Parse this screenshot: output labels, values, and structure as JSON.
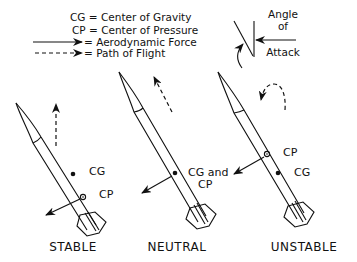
{
  "legend": {
    "cg": "CG = Center of Gravity",
    "cp": "CP = Center of Pressure",
    "force": "= Aerodynamic Force",
    "path": "= Path of Flight"
  },
  "angle_of_attack": {
    "line1": "Angle",
    "line2": "of",
    "line3": "Attack"
  },
  "rockets": [
    {
      "label": "STABLE",
      "marker1": "CG",
      "marker2": "CP"
    },
    {
      "label": "NEUTRAL",
      "marker1": "CG and",
      "marker2": "CP"
    },
    {
      "label": "UNSTABLE",
      "marker1": "CP",
      "marker2": "CG"
    }
  ]
}
